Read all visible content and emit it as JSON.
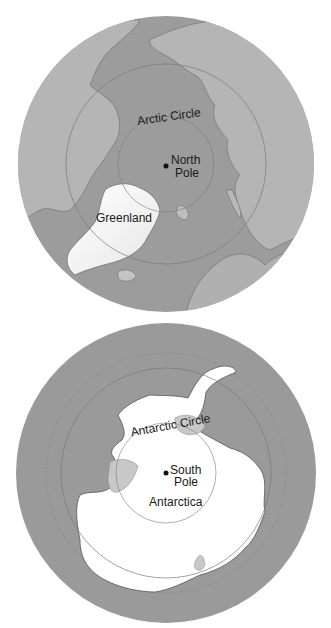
{
  "arctic_map": {
    "circle_label": "Arctic Circle",
    "pole_label_line1": "North",
    "pole_label_line2": "Pole",
    "landmass_label": "Greenland"
  },
  "antarctic_map": {
    "circle_label": "Antarctic Circle",
    "pole_label_line1": "South",
    "pole_label_line2": "Pole",
    "continent_label": "Antarctica"
  },
  "colors": {
    "ocean": "#9a9a9a",
    "land": "#b3b3b3",
    "ice": "#ffffff",
    "ice_shelf": "#c8c8c8",
    "circle_line": "#7a7a7a"
  }
}
